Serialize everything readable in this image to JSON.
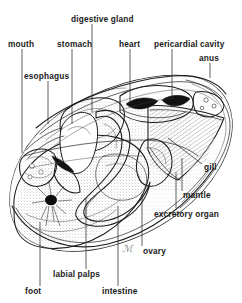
{
  "figure": {
    "background_color": "#ffffff",
    "ink_color": "#1a1a1a",
    "style": "pen-and-ink stipple line drawing"
  },
  "labels": [
    {
      "id": "digestive-gland",
      "text": "digestive gland",
      "x": 71,
      "y": 19,
      "anchor": "start"
    },
    {
      "id": "mouth",
      "text": "mouth",
      "x": 8,
      "y": 44,
      "anchor": "start"
    },
    {
      "id": "stomach",
      "text": "stomach",
      "x": 57,
      "y": 44,
      "anchor": "start"
    },
    {
      "id": "heart",
      "text": "heart",
      "x": 119,
      "y": 44,
      "anchor": "start"
    },
    {
      "id": "pericardial-cavity",
      "text": "pericardial cavity",
      "x": 155,
      "y": 44,
      "anchor": "start"
    },
    {
      "id": "anus",
      "text": "anus",
      "x": 200,
      "y": 58,
      "anchor": "start"
    },
    {
      "id": "esophagus",
      "text": "esophagus",
      "x": 25,
      "y": 76,
      "anchor": "start"
    },
    {
      "id": "gill",
      "text": "gill",
      "x": 204,
      "y": 167,
      "anchor": "start"
    },
    {
      "id": "mantle",
      "text": "mantle",
      "x": 184,
      "y": 195,
      "anchor": "start"
    },
    {
      "id": "excretory-organ",
      "text": "excretory organ",
      "x": 155,
      "y": 214,
      "anchor": "start"
    },
    {
      "id": "ovary",
      "text": "ovary",
      "x": 144,
      "y": 251,
      "anchor": "start"
    },
    {
      "id": "labial-palps",
      "text": "labial palps",
      "x": 54,
      "y": 274,
      "anchor": "start"
    },
    {
      "id": "foot",
      "text": "foot",
      "x": 26,
      "y": 291,
      "anchor": "start"
    },
    {
      "id": "intestine",
      "text": "intestine",
      "x": 103,
      "y": 291,
      "anchor": "start"
    }
  ],
  "leaders": [
    {
      "id": "leader-digestive-gland",
      "d": "M 92,24 L 92,112"
    },
    {
      "id": "leader-mouth",
      "d": "M 22,49 L 22,153"
    },
    {
      "id": "leader-stomach",
      "d": "M 72,49 L 72,124"
    },
    {
      "id": "leader-heart",
      "d": "M 130,49 L 130,104"
    },
    {
      "id": "leader-pericardial-cavity",
      "d": "M 172,49 L 172,98"
    },
    {
      "id": "leader-anus",
      "d": "M 210,63 L 210,76"
    },
    {
      "id": "leader-esophagus",
      "d": "M 48,81 L 48,120"
    },
    {
      "id": "leader-gill",
      "d": "M 202,164 L 168,138"
    },
    {
      "id": "leader-mantle",
      "d": "M 182,191 L 182,160"
    },
    {
      "id": "leader-excretory-organ",
      "d": "M 176,208 L 176,176"
    },
    {
      "id": "leader-ovary",
      "d": "M 142,246 L 142,196"
    },
    {
      "id": "leader-labial-palps",
      "d": "M 86,269 L 86,200"
    },
    {
      "id": "leader-foot",
      "d": "M 40,286 L 40,222"
    },
    {
      "id": "leader-intestine",
      "d": "M 118,286 L 118,206"
    }
  ],
  "signature": {
    "id": "artist-mark",
    "text": "ℳ",
    "x": 124,
    "y": 250
  }
}
